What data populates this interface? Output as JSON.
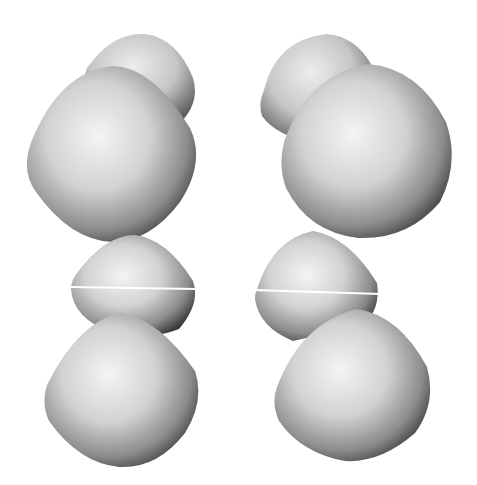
{
  "scene": {
    "description": "Grayscale 3D rendering of two columns of rounded lobe shapes",
    "background": "#ffffff",
    "colors": {
      "highlight": "#f2f2f2",
      "mid": "#b5b5b5",
      "shadow": "#3a3a3a",
      "seam": "#ffffff"
    },
    "columns": [
      {
        "name": "left",
        "lobes": [
          "back-top",
          "front-top",
          "middle",
          "bottom"
        ]
      },
      {
        "name": "right",
        "lobes": [
          "back-top",
          "front-top",
          "middle",
          "bottom"
        ]
      }
    ]
  }
}
